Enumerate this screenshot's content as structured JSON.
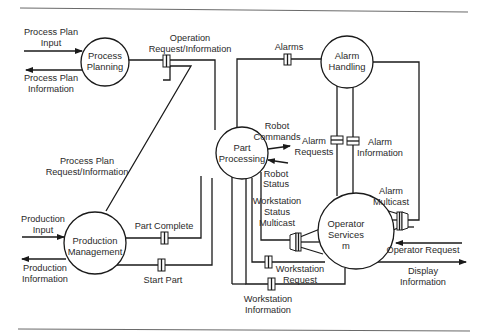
{
  "diagram": {
    "type": "data-flow",
    "nodes": {
      "process_planning": {
        "line1": "Process",
        "line2": "Planning"
      },
      "part_processing": {
        "line1": "Part",
        "line2": "Processing"
      },
      "alarm_handling": {
        "line1": "Alarm",
        "line2": "Handling"
      },
      "production_management": {
        "line1": "Production",
        "line2": "Management"
      },
      "operator_services": {
        "line1": "Operator",
        "line2": "Services",
        "line3": "m"
      }
    },
    "external_flows": {
      "process_plan_input": {
        "line1": "Process Plan",
        "line2": "Input"
      },
      "process_plan_information": {
        "line1": "Process Plan",
        "line2": "Information"
      },
      "production_input": {
        "line1": "Production",
        "line2": "Input"
      },
      "production_information": {
        "line1": "Production",
        "line2": "Information"
      },
      "robot_commands": {
        "line1": "Robot",
        "line2": "Commands"
      },
      "robot_status": {
        "line1": "Robot",
        "line2": "Status"
      },
      "operator_request": {
        "line1": "Operator Request"
      },
      "display_information": {
        "line1": "Display",
        "line2": "Information"
      }
    },
    "connectors": {
      "operation_request_information": {
        "line1": "Operation",
        "line2": "Request/Information"
      },
      "process_plan_request_information": {
        "line1": "Process Plan",
        "line2": "Request/Information"
      },
      "alarms": {
        "line1": "Alarms"
      },
      "alarm_requests": {
        "line1": "Alarm",
        "line2": "Requests"
      },
      "alarm_information": {
        "line1": "Alarm",
        "line2": "Information"
      },
      "alarm_multicast": {
        "line1": "Alarm",
        "line2": "Multicast"
      },
      "part_complete": {
        "line1": "Part Complete"
      },
      "start_part": {
        "line1": "Start Part"
      },
      "workstation_status_multicast": {
        "line1": "Workstation",
        "line2": "Status",
        "line3": "Multicast"
      },
      "workstation_request": {
        "line1": "Workstation",
        "line2": "Request"
      },
      "workstation_information": {
        "line1": "Workstation",
        "line2": "Information"
      }
    }
  }
}
